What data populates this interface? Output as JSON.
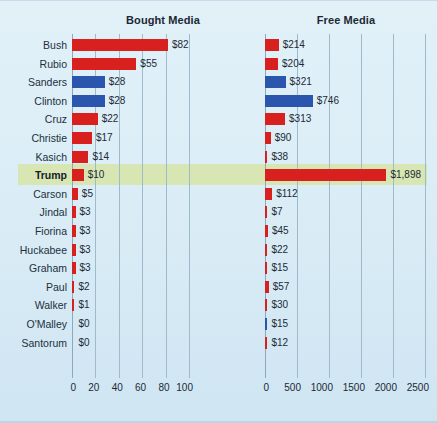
{
  "panels": {
    "left_title": "Bought Media",
    "right_title": "Free Media"
  },
  "highlight": {
    "candidate": "Trump",
    "color": "#d8e6b4"
  },
  "colors": {
    "republican": "#d8201f",
    "democrat": "#2a57ad",
    "background": "#dff0f7",
    "gridline": "#9fbacb",
    "text": "#1b2a35"
  },
  "axis_left": {
    "ticks": [
      "0",
      "20",
      "40",
      "60",
      "80",
      "100"
    ],
    "values": [
      0,
      20,
      40,
      60,
      80,
      100
    ],
    "max": 100
  },
  "axis_right": {
    "ticks": [
      "0",
      "500",
      "1000",
      "1500",
      "2000",
      "2500"
    ],
    "values": [
      0,
      500,
      1000,
      1500,
      2000,
      2500
    ],
    "max": 2500
  },
  "chart_data": {
    "type": "bar",
    "xlabel": "",
    "ylabel": "",
    "orientation": "horizontal",
    "grid": true,
    "legend": "none",
    "categories": [
      "Bush",
      "Rubio",
      "Sanders",
      "Clinton",
      "Cruz",
      "Christie",
      "Kasich",
      "Trump",
      "Carson",
      "Jindal",
      "Fiorina",
      "Huckabee",
      "Graham",
      "Paul",
      "Walker",
      "O'Malley",
      "Santorum"
    ],
    "party": [
      "republican",
      "republican",
      "democrat",
      "democrat",
      "republican",
      "republican",
      "republican",
      "republican",
      "republican",
      "republican",
      "republican",
      "republican",
      "republican",
      "republican",
      "republican",
      "democrat",
      "republican"
    ],
    "series": [
      {
        "name": "Bought Media",
        "xlim": [
          0,
          100
        ],
        "values": [
          82,
          55,
          28,
          28,
          22,
          17,
          14,
          10,
          5,
          3,
          3,
          3,
          3,
          2,
          1,
          0,
          0
        ],
        "labels": [
          "$82",
          "$55",
          "$28",
          "$28",
          "$22",
          "$17",
          "$14",
          "$10",
          "$5",
          "$3",
          "$3",
          "$3",
          "$3",
          "$2",
          "$1",
          "$0",
          "$0"
        ]
      },
      {
        "name": "Free Media",
        "xlim": [
          0,
          2500
        ],
        "values": [
          214,
          204,
          321,
          746,
          313,
          90,
          38,
          1898,
          112,
          7,
          45,
          22,
          15,
          57,
          30,
          15,
          12
        ],
        "labels": [
          "$214",
          "$204",
          "$321",
          "$746",
          "$313",
          "$90",
          "$38",
          "$1,898",
          "$112",
          "$7",
          "$45",
          "$22",
          "$15",
          "$57",
          "$30",
          "$15",
          "$12"
        ]
      }
    ]
  }
}
